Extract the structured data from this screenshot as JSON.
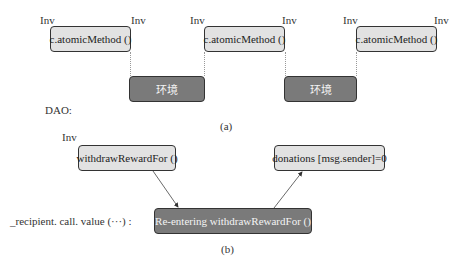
{
  "panel_a": {
    "inv_labels": [
      "Inv",
      "Inv",
      "Inv",
      "Inv",
      "Inv",
      "Inv"
    ],
    "method_boxes": [
      "c.atomicMethod ()",
      "c.atomicMethod ()",
      "c.atomicMethod ()"
    ],
    "env_boxes": [
      "环境",
      "环境"
    ],
    "row_label": "DAO:",
    "caption": "(a)"
  },
  "panel_b": {
    "inv_label": "Inv",
    "withdraw_box": "withdrawRewardFor ()",
    "donations_box": "donations [msg.sender]=0",
    "reenter_box": "Re-entering withdrawRewardFor ()",
    "row_label": "_recipient. call. value (···) :",
    "caption": "(b)"
  },
  "colors": {
    "light_box": "#e2e2e2",
    "dark_box": "#7a7a7a",
    "border": "#333333"
  }
}
